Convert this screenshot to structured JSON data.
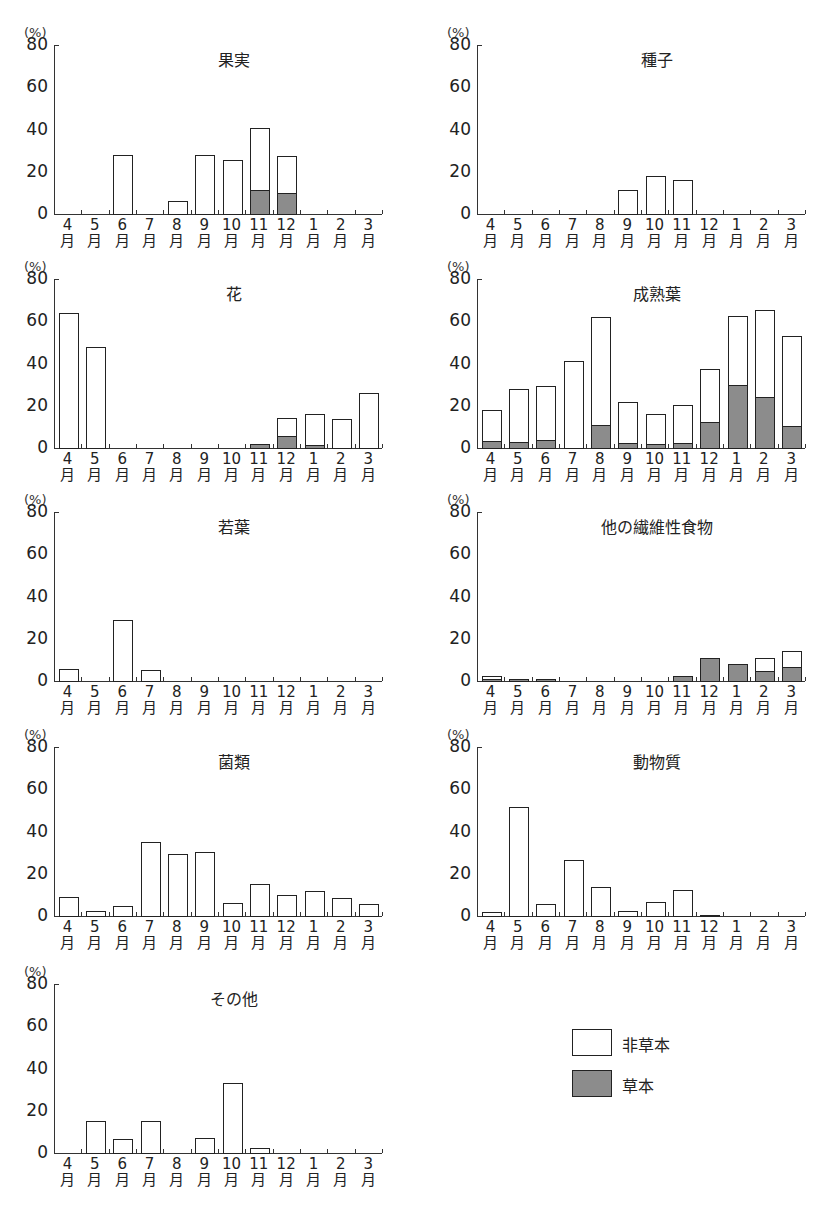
{
  "units_label": "(%)",
  "y_ticks": [
    "80",
    "60",
    "40",
    "20",
    "0"
  ],
  "months": [
    "4",
    "5",
    "6",
    "7",
    "8",
    "9",
    "10",
    "11",
    "12",
    "1",
    "2",
    "3"
  ],
  "month_suffix": "月",
  "legend": {
    "non_herb": {
      "label": "非草本",
      "color": "#ffffff"
    },
    "herb": {
      "label": "草本",
      "color": "#8c8c8c"
    }
  },
  "chart_data": [
    {
      "type": "bar",
      "stacked": true,
      "title": "果実",
      "xlabel": "",
      "ylabel": "(%)",
      "ylim": [
        0,
        80
      ],
      "categories": [
        "4月",
        "5月",
        "6月",
        "7月",
        "8月",
        "9月",
        "10月",
        "11月",
        "12月",
        "1月",
        "2月",
        "3月"
      ],
      "series": [
        {
          "name": "草本",
          "values": [
            0,
            0,
            0,
            0,
            0,
            0,
            0,
            11.5,
            10,
            0,
            0,
            0
          ]
        },
        {
          "name": "非草本",
          "values": [
            0,
            0,
            28,
            0,
            6,
            28,
            25.5,
            29,
            17.5,
            0,
            0,
            0
          ]
        }
      ],
      "totals": [
        0,
        0,
        28,
        0,
        6,
        28,
        25.5,
        40.5,
        27.5,
        0,
        0,
        0
      ]
    },
    {
      "type": "bar",
      "stacked": true,
      "title": "種子",
      "xlabel": "",
      "ylabel": "(%)",
      "ylim": [
        0,
        80
      ],
      "categories": [
        "4月",
        "5月",
        "6月",
        "7月",
        "8月",
        "9月",
        "10月",
        "11月",
        "12月",
        "1月",
        "2月",
        "3月"
      ],
      "series": [
        {
          "name": "草本",
          "values": [
            0,
            0,
            0,
            0,
            0,
            0,
            0,
            0,
            0,
            0,
            0,
            0
          ]
        },
        {
          "name": "非草本",
          "values": [
            0,
            0,
            0,
            0,
            0,
            11.5,
            18,
            16,
            0,
            0,
            0,
            0
          ]
        }
      ],
      "totals": [
        0,
        0,
        0,
        0,
        0,
        11.5,
        18,
        16,
        0,
        0,
        0,
        0
      ]
    },
    {
      "type": "bar",
      "stacked": true,
      "title": "花",
      "xlabel": "",
      "ylabel": "(%)",
      "ylim": [
        0,
        80
      ],
      "categories": [
        "4月",
        "5月",
        "6月",
        "7月",
        "8月",
        "9月",
        "10月",
        "11月",
        "12月",
        "1月",
        "2月",
        "3月"
      ],
      "series": [
        {
          "name": "草本",
          "values": [
            0,
            0,
            0,
            0,
            0,
            0,
            0,
            2,
            5.5,
            1.5,
            0,
            0
          ]
        },
        {
          "name": "非草本",
          "values": [
            64,
            48,
            0,
            0,
            0,
            0,
            0,
            0,
            8.5,
            14.5,
            13.5,
            26
          ]
        }
      ],
      "totals": [
        64,
        48,
        0,
        0,
        0,
        0,
        0,
        2,
        14,
        16,
        13.5,
        26
      ]
    },
    {
      "type": "bar",
      "stacked": true,
      "title": "成熟葉",
      "xlabel": "",
      "ylabel": "(%)",
      "ylim": [
        0,
        80
      ],
      "categories": [
        "4月",
        "5月",
        "6月",
        "7月",
        "8月",
        "9月",
        "10月",
        "11月",
        "12月",
        "1月",
        "2月",
        "3月"
      ],
      "series": [
        {
          "name": "草本",
          "values": [
            3.5,
            3,
            4,
            0,
            11,
            2.5,
            2,
            2.5,
            12.5,
            30,
            24,
            10.5
          ]
        },
        {
          "name": "非草本",
          "values": [
            14.5,
            25,
            25.5,
            41,
            51,
            19.5,
            14,
            18,
            25,
            32.5,
            41.5,
            42.5
          ]
        }
      ],
      "totals": [
        18,
        28,
        29.5,
        41,
        62,
        22,
        16,
        20.5,
        37.5,
        62.5,
        65.5,
        53
      ]
    },
    {
      "type": "bar",
      "stacked": true,
      "title": "若葉",
      "xlabel": "",
      "ylabel": "(%)",
      "ylim": [
        0,
        80
      ],
      "categories": [
        "4月",
        "5月",
        "6月",
        "7月",
        "8月",
        "9月",
        "10月",
        "11月",
        "12月",
        "1月",
        "2月",
        "3月"
      ],
      "series": [
        {
          "name": "草本",
          "values": [
            0,
            0,
            0,
            0,
            0,
            0,
            0,
            0,
            0,
            0,
            0,
            0
          ]
        },
        {
          "name": "非草本",
          "values": [
            5.5,
            0,
            29,
            5,
            0,
            0,
            0,
            0,
            0,
            0,
            0,
            0
          ]
        }
      ],
      "totals": [
        5.5,
        0,
        29,
        5,
        0,
        0,
        0,
        0,
        0,
        0,
        0,
        0
      ]
    },
    {
      "type": "bar",
      "stacked": true,
      "title": "他の繊維性食物",
      "xlabel": "",
      "ylabel": "(%)",
      "ylim": [
        0,
        80
      ],
      "categories": [
        "4月",
        "5月",
        "6月",
        "7月",
        "8月",
        "9月",
        "10月",
        "11月",
        "12月",
        "1月",
        "2月",
        "3月"
      ],
      "series": [
        {
          "name": "草本",
          "values": [
            1,
            1,
            1,
            0,
            0,
            0,
            0,
            2.5,
            11,
            8,
            4.5,
            6.5
          ]
        },
        {
          "name": "非草本",
          "values": [
            1.5,
            0,
            0,
            0,
            0,
            0,
            0,
            0,
            0,
            0,
            6.5,
            7.5
          ]
        }
      ],
      "totals": [
        2.5,
        1,
        1,
        0,
        0,
        0,
        0,
        2.5,
        11,
        8,
        11,
        14
      ]
    },
    {
      "type": "bar",
      "stacked": true,
      "title": "菌類",
      "xlabel": "",
      "ylabel": "(%)",
      "ylim": [
        0,
        80
      ],
      "categories": [
        "4月",
        "5月",
        "6月",
        "7月",
        "8月",
        "9月",
        "10月",
        "11月",
        "12月",
        "1月",
        "2月",
        "3月"
      ],
      "series": [
        {
          "name": "草本",
          "values": [
            0,
            0,
            0,
            0,
            0,
            0,
            0,
            0,
            0,
            0,
            0,
            0
          ]
        },
        {
          "name": "非草本",
          "values": [
            9,
            2.5,
            4.5,
            35,
            29.5,
            30.5,
            6,
            15,
            10,
            12,
            8.5,
            5.5
          ]
        }
      ],
      "totals": [
        9,
        2.5,
        4.5,
        35,
        29.5,
        30.5,
        6,
        15,
        10,
        12,
        8.5,
        5.5
      ]
    },
    {
      "type": "bar",
      "stacked": true,
      "title": "動物質",
      "xlabel": "",
      "ylabel": "(%)",
      "ylim": [
        0,
        80
      ],
      "categories": [
        "4月",
        "5月",
        "6月",
        "7月",
        "8月",
        "9月",
        "10月",
        "11月",
        "12月",
        "1月",
        "2月",
        "3月"
      ],
      "series": [
        {
          "name": "草本",
          "values": [
            0,
            0,
            0,
            0,
            0,
            0,
            0,
            0,
            0.5,
            0,
            0,
            0
          ]
        },
        {
          "name": "非草本",
          "values": [
            2,
            51.5,
            5.5,
            26.5,
            13.5,
            2.5,
            6.5,
            12.5,
            0,
            0,
            0,
            0
          ]
        }
      ],
      "totals": [
        2,
        51.5,
        5.5,
        26.5,
        13.5,
        2.5,
        6.5,
        12.5,
        0.5,
        0,
        0,
        0
      ]
    },
    {
      "type": "bar",
      "stacked": true,
      "title": "その他",
      "xlabel": "",
      "ylabel": "(%)",
      "ylim": [
        0,
        80
      ],
      "categories": [
        "4月",
        "5月",
        "6月",
        "7月",
        "8月",
        "9月",
        "10月",
        "11月",
        "12月",
        "1月",
        "2月",
        "3月"
      ],
      "series": [
        {
          "name": "草本",
          "values": [
            0,
            0,
            0,
            0,
            0,
            0,
            0,
            0,
            0,
            0,
            0,
            0
          ]
        },
        {
          "name": "非草本",
          "values": [
            0,
            15,
            6.5,
            15,
            0,
            7,
            33,
            2.5,
            0,
            0,
            0,
            0
          ]
        }
      ],
      "totals": [
        0,
        15,
        6.5,
        15,
        0,
        7,
        33,
        2.5,
        0,
        0,
        0,
        0
      ]
    }
  ]
}
